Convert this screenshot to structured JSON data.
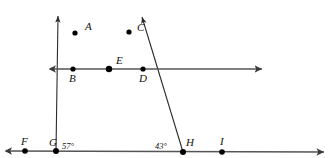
{
  "figure": {
    "type": "geometry-diagram",
    "background_color": "#ffffff",
    "line_color": "#2b2b2b",
    "base_line_color": "#555555",
    "dot_color": "#000000"
  },
  "points": [
    {
      "id": "A",
      "label": "A",
      "x": 75,
      "y": 33,
      "label_x": 85,
      "label_y": 30
    },
    {
      "id": "C",
      "label": "C",
      "x": 129,
      "y": 32,
      "label_x": 137,
      "label_y": 31
    },
    {
      "id": "B",
      "label": "B",
      "x": 73,
      "y": 69,
      "label_x": 69,
      "label_y": 81
    },
    {
      "id": "E",
      "label": "E",
      "x": 109,
      "y": 69,
      "label_x": 116,
      "label_y": 64
    },
    {
      "id": "D",
      "label": "D",
      "x": 143,
      "y": 69,
      "label_x": 139,
      "label_y": 81
    },
    {
      "id": "F",
      "label": "F",
      "x": 25,
      "y": 151,
      "label_x": 21,
      "label_y": 144
    },
    {
      "id": "G",
      "label": "G",
      "x": 56,
      "y": 151,
      "label_x": 49,
      "label_y": 145
    },
    {
      "id": "H",
      "label": "H",
      "x": 183,
      "y": 152,
      "label_x": 186,
      "label_y": 145
    },
    {
      "id": "I",
      "label": "I",
      "x": 222,
      "y": 152,
      "label_x": 221,
      "label_y": 144
    }
  ],
  "angles": [
    {
      "id": "angle-G",
      "value": "57",
      "text": "57°",
      "vertex": "G",
      "label_x": 62,
      "label_y": 148
    },
    {
      "id": "angle-H",
      "value": "43",
      "text": "43°",
      "vertex": "H",
      "label_x": 156,
      "label_y": 148
    }
  ],
  "lines": [
    {
      "id": "middle-horizontal-line",
      "name": "line-BED",
      "through": [
        "B",
        "E",
        "D"
      ],
      "x1": 50,
      "y1": 69,
      "x2": 262,
      "y2": 69,
      "arrow_start": true,
      "arrow_end": true
    },
    {
      "id": "bottom-horizontal-line",
      "name": "line-FGHI",
      "through": [
        "F",
        "G",
        "H",
        "I"
      ],
      "x1": 5,
      "y1": 151,
      "x2": 325,
      "y2": 152,
      "arrow_start": true,
      "arrow_end": true
    },
    {
      "id": "ray-G-through-E-to-A",
      "name": "ray-GA",
      "through": [
        "G",
        "E",
        "A"
      ],
      "x1": 56,
      "y1": 151,
      "x2": 58,
      "y2": 15,
      "arrow_start": false,
      "arrow_end": true
    },
    {
      "id": "ray-H-through-E-to-C",
      "name": "ray-HC",
      "through": [
        "H",
        "E",
        "C"
      ],
      "x1": 183,
      "y1": 152,
      "x2": 142,
      "y2": 16,
      "arrow_start": false,
      "arrow_end": true
    }
  ]
}
